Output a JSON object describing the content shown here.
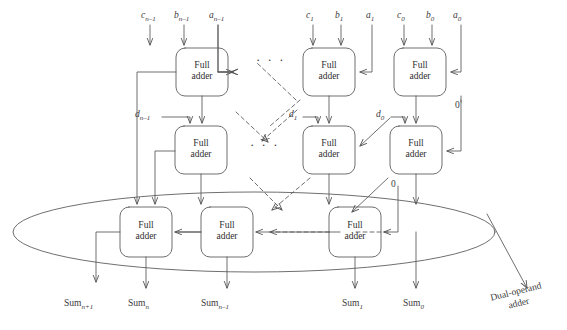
{
  "diagram": {
    "type": "block-diagram",
    "colors": {
      "stroke": "#555555",
      "text": "#333333",
      "background": "#ffffff"
    },
    "adder_label_line1": "Full",
    "adder_label_line2": "adder",
    "ellipsis": "· · ·",
    "annotation": {
      "line1": "Dual-operand",
      "line2": "adder"
    },
    "rows": [
      {
        "name": "carry-save-row-1",
        "adders": [
          {
            "name": "full-adder-n-1",
            "x": 176,
            "y": 48,
            "w": 52,
            "h": 48,
            "inputs": [
              "c_n-1",
              "b_n-1",
              "a_n-1"
            ]
          },
          {
            "name": "full-adder-1",
            "x": 303,
            "y": 48,
            "w": 52,
            "h": 48,
            "inputs": [
              "c_1",
              "b_1",
              "a_1"
            ]
          },
          {
            "name": "full-adder-0",
            "x": 394,
            "y": 48,
            "w": 52,
            "h": 48,
            "inputs": [
              "c_0",
              "b_0",
              "a_0"
            ]
          }
        ]
      },
      {
        "name": "carry-save-row-2",
        "adders": [
          {
            "name": "full-adder-d-n-1",
            "x": 175,
            "y": 126,
            "w": 52,
            "h": 48
          },
          {
            "name": "full-adder-d-1",
            "x": 303,
            "y": 126,
            "w": 52,
            "h": 48
          },
          {
            "name": "full-adder-d-0",
            "x": 390,
            "y": 126,
            "w": 52,
            "h": 48
          }
        ]
      },
      {
        "name": "dual-operand-adder-row",
        "adders": [
          {
            "name": "final-adder-msb",
            "x": 120,
            "y": 207,
            "w": 52,
            "h": 50
          },
          {
            "name": "final-adder-n",
            "x": 201,
            "y": 207,
            "w": 52,
            "h": 50
          },
          {
            "name": "final-adder-lsb",
            "x": 329,
            "y": 207,
            "w": 52,
            "h": 50
          }
        ]
      }
    ],
    "input_labels": [
      {
        "name": "input-c-n-1",
        "base": "c",
        "sub": "n–1",
        "x": 141,
        "y": 11
      },
      {
        "name": "input-b-n-1",
        "base": "b",
        "sub": "n–1",
        "x": 174,
        "y": 11
      },
      {
        "name": "input-a-n-1",
        "base": "a",
        "sub": "n–1",
        "x": 209,
        "y": 11
      },
      {
        "name": "input-c-1",
        "base": "c",
        "sub": "1",
        "x": 305,
        "y": 11
      },
      {
        "name": "input-b-1",
        "base": "b",
        "sub": "1",
        "x": 334,
        "y": 11
      },
      {
        "name": "input-a-1",
        "base": "a",
        "sub": "1",
        "x": 365,
        "y": 11
      },
      {
        "name": "input-c-0",
        "base": "c",
        "sub": "0",
        "x": 396,
        "y": 11
      },
      {
        "name": "input-b-0",
        "base": "b",
        "sub": "0",
        "x": 425,
        "y": 11
      },
      {
        "name": "input-a-0",
        "base": "a",
        "sub": "0",
        "x": 452,
        "y": 11
      }
    ],
    "d_labels": [
      {
        "name": "signal-d-n-1",
        "base": "d",
        "sub": "n–1",
        "x": 135,
        "y": 110
      },
      {
        "name": "signal-d-1",
        "base": "d",
        "sub": "1",
        "x": 289,
        "y": 110
      },
      {
        "name": "signal-d-0",
        "base": "d",
        "sub": "0",
        "x": 376,
        "y": 110
      }
    ],
    "zero_labels": [
      {
        "name": "constant-zero-upper",
        "text": "0",
        "x": 455,
        "y": 104
      },
      {
        "name": "constant-zero-lower",
        "text": "0",
        "x": 393,
        "y": 182
      }
    ],
    "sum_labels": [
      {
        "name": "output-sum-n+1",
        "base": "Sum",
        "sub": "n+1",
        "x": 64,
        "y": 300
      },
      {
        "name": "output-sum-n",
        "base": "Sum",
        "sub": "n",
        "x": 128,
        "y": 300
      },
      {
        "name": "output-sum-n-1",
        "base": "Sum",
        "sub": "n–1",
        "x": 200,
        "y": 300
      },
      {
        "name": "output-sum-1",
        "base": "Sum",
        "sub": "1",
        "x": 343,
        "y": 300
      },
      {
        "name": "output-sum-0",
        "base": "Sum",
        "sub": "0",
        "x": 404,
        "y": 300
      }
    ],
    "ellipsis_marks": [
      {
        "name": "ellipsis-row-1",
        "x": 258,
        "y": 57
      },
      {
        "name": "ellipsis-row-2",
        "x": 252,
        "y": 142
      }
    ],
    "ellipse": {
      "name": "dual-operand-adder-boundary",
      "cx": 254,
      "cy": 232,
      "rx": 241,
      "ry": 40
    }
  }
}
